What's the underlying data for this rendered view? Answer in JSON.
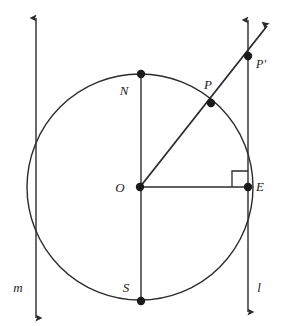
{
  "figure": {
    "background_color": "#ffffff",
    "stroke_color": "#2b2b2b",
    "point_fill_color": "#1a1a1a",
    "canvas": {
      "width": 285,
      "height": 326
    }
  },
  "circle": {
    "name": "main-circle",
    "center_label": "O",
    "cx": 140,
    "cy": 187,
    "r": 113,
    "stroke_width": 1.4
  },
  "lines": [
    {
      "id": "line-m",
      "label": "m",
      "orientation": "vertical",
      "x": 36,
      "y_top": 18,
      "y_bottom": 318,
      "arrow_top": true,
      "arrow_bottom": true,
      "label_x": 18,
      "label_y": 287
    },
    {
      "id": "line-l",
      "label": "l",
      "orientation": "vertical",
      "x": 248,
      "y_top": 20,
      "y_bottom": 312,
      "arrow_top": true,
      "arrow_bottom": true,
      "label_x": 259,
      "label_y": 287
    }
  ],
  "segments": [
    {
      "id": "segment-NS",
      "from": "N",
      "to": "S",
      "x1": 141,
      "y1": 74,
      "x2": 141,
      "y2": 301
    },
    {
      "id": "segment-OE",
      "from": "O",
      "to": "E",
      "x1": 140,
      "y1": 187,
      "x2": 248,
      "y2": 187
    }
  ],
  "rays": [
    {
      "id": "ray-OP-Pprime",
      "from": "O",
      "through": [
        "P",
        "P'"
      ],
      "x1": 140,
      "y1": 187,
      "x2": 267,
      "y2": 26,
      "arrow_end": true
    }
  ],
  "right_angle": {
    "id": "right-angle-at-E",
    "at_point": "E",
    "x": 232,
    "y": 171,
    "size": 16
  },
  "points": [
    {
      "id": "point-N",
      "label": "N",
      "x": 141,
      "y": 74,
      "label_x": 124,
      "label_y": 90,
      "radius": 4.2
    },
    {
      "id": "point-S",
      "label": "S",
      "x": 141,
      "y": 301,
      "label_x": 126,
      "label_y": 287,
      "radius": 4.2
    },
    {
      "id": "point-O",
      "label": "O",
      "x": 140,
      "y": 187,
      "label_x": 120,
      "label_y": 187,
      "radius": 4.2
    },
    {
      "id": "point-E",
      "label": "E",
      "x": 248,
      "y": 187,
      "label_x": 260,
      "label_y": 186,
      "radius": 4.2
    },
    {
      "id": "point-P",
      "label": "P",
      "x": 211,
      "y": 103,
      "label_x": 208,
      "label_y": 84,
      "radius": 4.2
    },
    {
      "id": "point-Pprime",
      "label": "P'",
      "x": 248,
      "y": 56,
      "label_x": 261,
      "label_y": 64,
      "radius": 4.2
    }
  ]
}
